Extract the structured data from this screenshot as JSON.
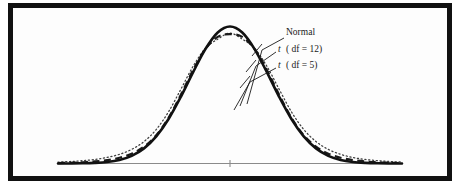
{
  "figure": {
    "background_color": "#fdfdfd",
    "frame_color": "#111111",
    "axis_color": "#8a8a8a"
  },
  "labels": {
    "normal": "Normal",
    "t12_prefix": "t",
    "t12_body": "( df = 12)",
    "t5_prefix": "t",
    "t5_body": "( df = 5)"
  },
  "chart_data": {
    "type": "line",
    "title": "",
    "subtitle": "",
    "xlabel": "",
    "ylabel": "",
    "grid": false,
    "legend_position": "inline-annotations",
    "xlim": [
      -4.2,
      4.2
    ],
    "ylim": [
      0,
      0.42
    ],
    "x_ticks": [
      0
    ],
    "x_tick_labels": [
      ""
    ],
    "annotations": [
      {
        "text": "Normal",
        "attaches_to": "Normal",
        "x": 1.05,
        "y": 0.355
      },
      {
        "text": "t ( df = 12)",
        "attaches_to": "t (df = 12)",
        "x": 1.35,
        "y": 0.3
      },
      {
        "text": "t ( df = 5)",
        "attaches_to": "t (df = 5)",
        "x": 1.55,
        "y": 0.255
      }
    ],
    "x": [
      -4.2,
      -3.9,
      -3.6,
      -3.3,
      -3.0,
      -2.7,
      -2.4,
      -2.1,
      -1.8,
      -1.5,
      -1.2,
      -0.9,
      -0.6,
      -0.3,
      0.0,
      0.3,
      0.6,
      0.9,
      1.2,
      1.5,
      1.8,
      2.1,
      2.4,
      2.7,
      3.0,
      3.3,
      3.6,
      3.9,
      4.2
    ],
    "series": [
      {
        "name": "Normal",
        "style": "solid",
        "color": "#111111",
        "peak": 0.3989,
        "values": [
          0.0001,
          0.0002,
          0.0006,
          0.0017,
          0.0044,
          0.0104,
          0.0224,
          0.044,
          0.079,
          0.1295,
          0.1942,
          0.2661,
          0.3332,
          0.3814,
          0.3989,
          0.3814,
          0.3332,
          0.2661,
          0.1942,
          0.1295,
          0.079,
          0.044,
          0.0224,
          0.0104,
          0.0044,
          0.0017,
          0.0006,
          0.0002,
          0.0001
        ]
      },
      {
        "name": "t (df = 12)",
        "style": "dashed",
        "color": "#1a1a1a",
        "peak": 0.3767,
        "values": [
          0.0013,
          0.0021,
          0.0035,
          0.0059,
          0.0099,
          0.0168,
          0.0287,
          0.049,
          0.0824,
          0.1331,
          0.2,
          0.2724,
          0.3333,
          0.3687,
          0.3767,
          0.3687,
          0.3333,
          0.2724,
          0.2,
          0.1331,
          0.0824,
          0.049,
          0.0287,
          0.0168,
          0.0099,
          0.0059,
          0.0035,
          0.0021,
          0.0013
        ]
      },
      {
        "name": "t (df = 5)",
        "style": "dotted",
        "color": "#3d3d3d",
        "peak": 0.3796,
        "values": [
          0.0042,
          0.0058,
          0.0082,
          0.0119,
          0.0176,
          0.0267,
          0.0411,
          0.0639,
          0.0991,
          0.1506,
          0.2162,
          0.2833,
          0.3354,
          0.362,
          0.3796,
          0.362,
          0.3354,
          0.2833,
          0.2162,
          0.1506,
          0.0991,
          0.0639,
          0.0411,
          0.0267,
          0.0176,
          0.0119,
          0.0082,
          0.0058,
          0.0042
        ]
      }
    ]
  }
}
